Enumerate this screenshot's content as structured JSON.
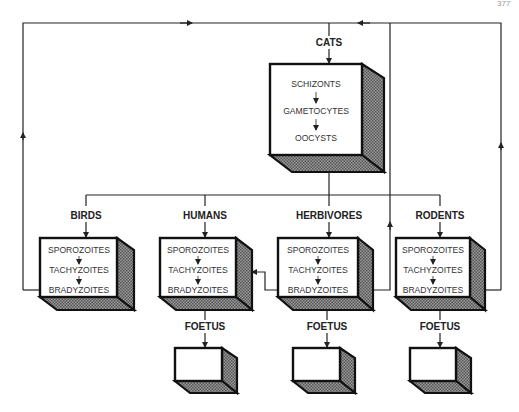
{
  "page_number": "377",
  "definitive_host": {
    "label": "CATS",
    "stages": [
      "SCHIZONTS",
      "GAMETOCYTES",
      "OOCYSTS"
    ]
  },
  "intermediate_hosts": [
    {
      "label": "BIRDS",
      "stages": [
        "SPOROZOITES",
        "TACHYZOITES",
        "BRADYZOITES"
      ],
      "foetus": false
    },
    {
      "label": "HUMANS",
      "stages": [
        "SPOROZOITES",
        "TACHYZOITES",
        "BRADYZOITES"
      ],
      "foetus": true
    },
    {
      "label": "HERBIVORES",
      "stages": [
        "SPOROZOITES",
        "TACHYZOITES",
        "BRADYZOITES"
      ],
      "foetus": true
    },
    {
      "label": "RODENTS",
      "stages": [
        "SPOROZOITES",
        "TACHYZOITES",
        "BRADYZOITES"
      ],
      "foetus": true
    }
  ],
  "foetus_label": "FOETUS",
  "colors": {
    "line": "#222222",
    "box_border": "#111111",
    "hatch": "#777777"
  }
}
